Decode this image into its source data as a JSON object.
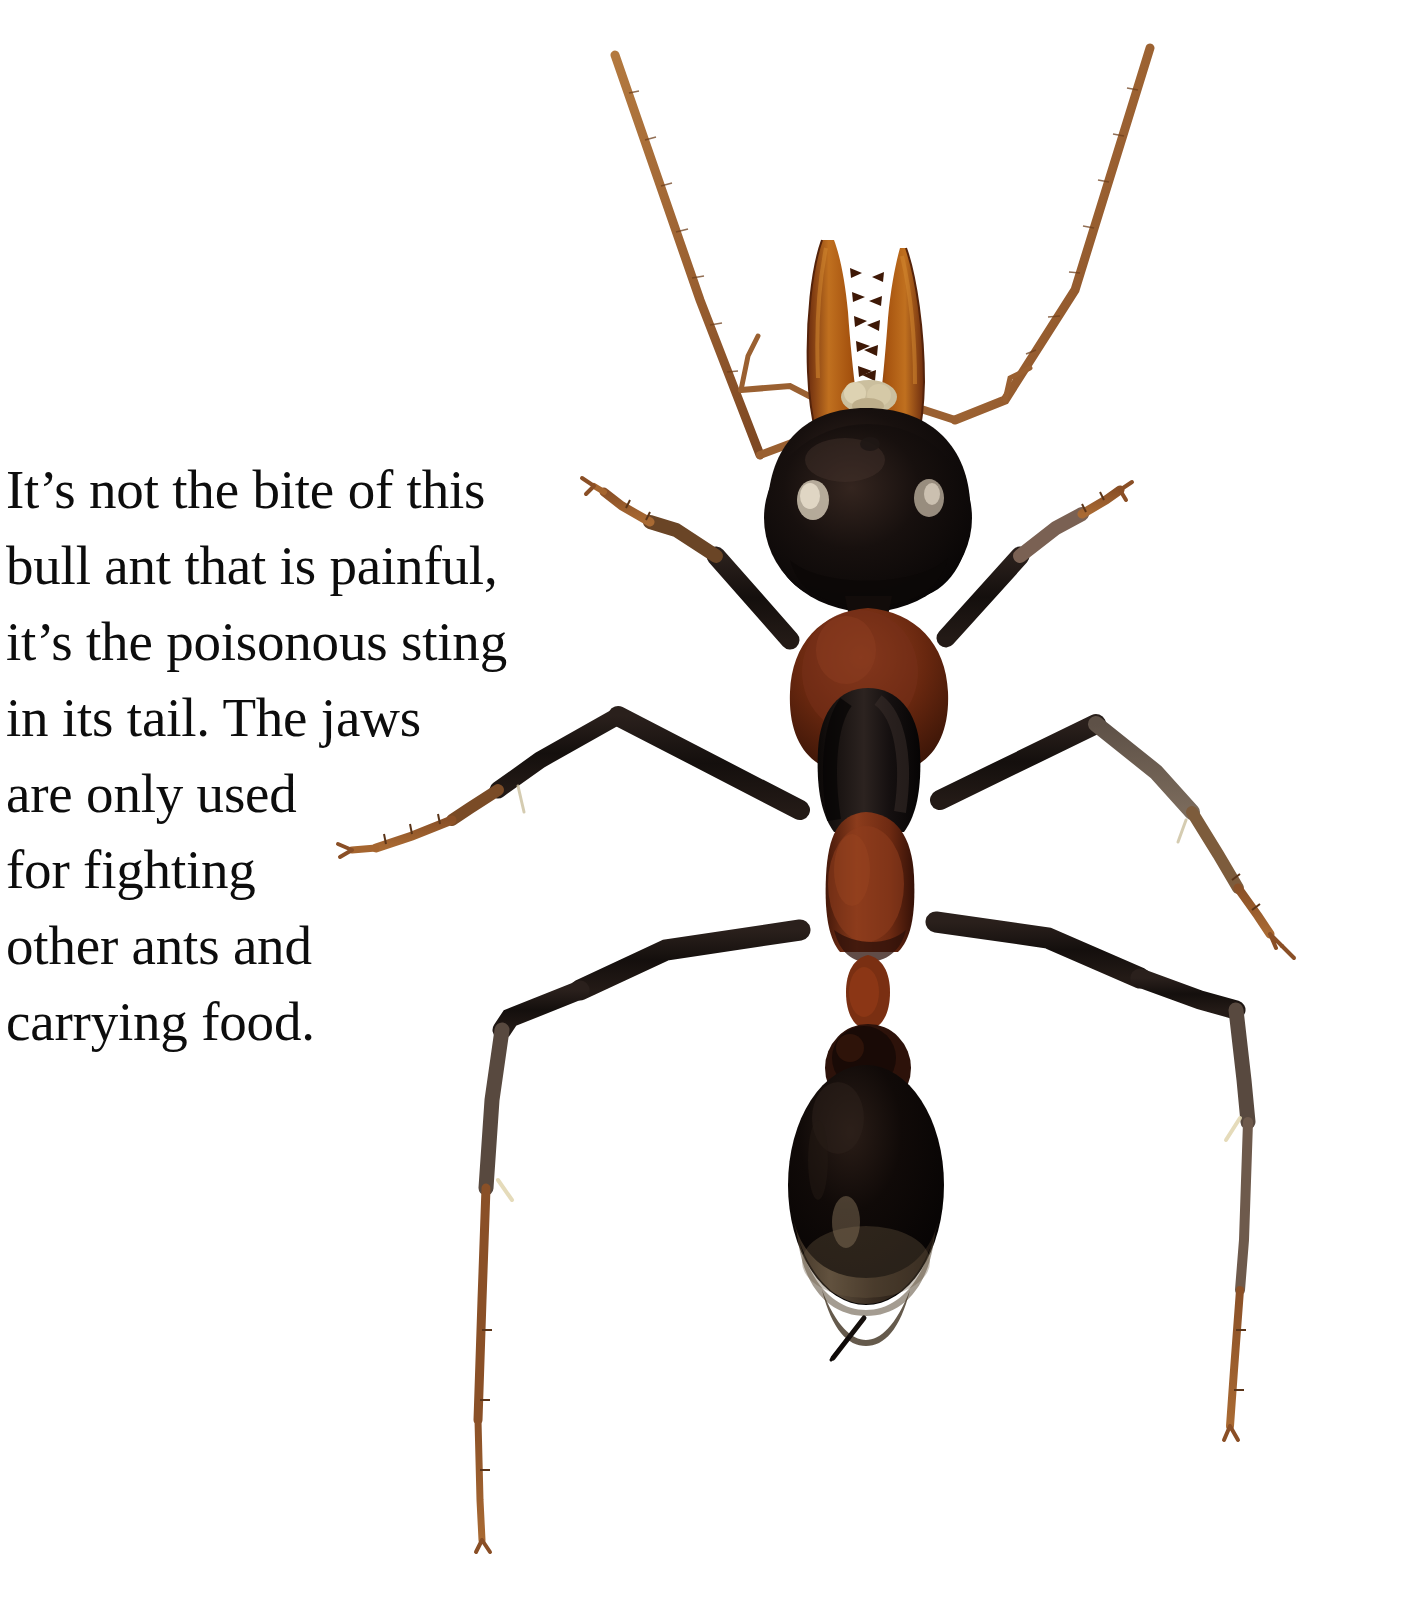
{
  "page": {
    "background_color": "#ffffff",
    "width": 1411,
    "height": 1619,
    "kind": "book-page-spread"
  },
  "caption": {
    "text": "It’s not the bite of this\nbull ant that is painful,\nit’s the poisonous sting\nin its tail. The jaws\nare only used\nfor fighting\nother ants and\ncarrying food.",
    "lines": [
      "It’s not the bite of this",
      "bull ant that is painful,",
      "it’s the poisonous sting",
      "in its tail. The jaws",
      "are only used",
      "for fighting",
      "other ants and",
      "carrying food."
    ],
    "color": "#0d0d0d",
    "align": "left"
  },
  "photo": {
    "subject": "bull-ant",
    "view": "dorsal",
    "background_color": "#ffffff",
    "colors": {
      "mandible_orange": "#b3541e",
      "mandible_orange_light": "#c9712b",
      "mandible_dark_edge": "#4a1f0c",
      "head_black": "#120d0c",
      "head_highlight": "#3a2b26",
      "eye_pale": "#d8cdbe",
      "thorax_red": "#6e2b16",
      "thorax_red_light": "#8a3a1e",
      "mesosoma_black": "#150f0e",
      "gaster_black": "#0e0a09",
      "gaster_band": "#6b5a46",
      "leg_black": "#1b1412",
      "leg_brown": "#8a4f26",
      "leg_grey": "#55483f",
      "tarsus_orange": "#a5652f",
      "antenna_tan": "#a8693a",
      "sting_dark": "#1a1210",
      "mouthparts_cream": "#cbbf9e"
    },
    "parts": [
      "left-antenna",
      "right-antenna",
      "left-mandible",
      "right-mandible",
      "mouthparts",
      "head",
      "left-eye",
      "right-eye",
      "pronotum",
      "mesonotum",
      "propodeum",
      "petiole",
      "postpetiole",
      "gaster",
      "sting",
      "left-foreleg",
      "right-foreleg",
      "left-midleg",
      "right-midleg",
      "left-hindleg",
      "right-hindleg"
    ]
  }
}
